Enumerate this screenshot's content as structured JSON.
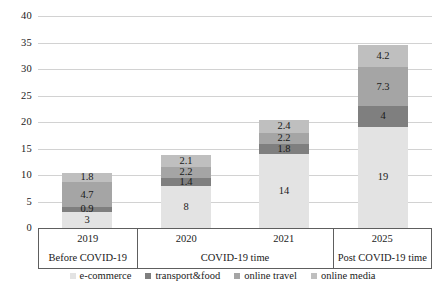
{
  "chart_data": {
    "type": "bar",
    "subtype": "stacked-bar",
    "title": "",
    "subtitle": "",
    "xlabel": "",
    "ylabel": "",
    "ylim": [
      0,
      40
    ],
    "ytick_labels": [
      "0",
      "5",
      "10",
      "15",
      "20",
      "25",
      "30",
      "35",
      "40"
    ],
    "ytick_values": [
      0,
      5,
      10,
      15,
      20,
      25,
      30,
      35,
      40
    ],
    "grid": true,
    "legend_position": "bottom",
    "categories": [
      "2019",
      "2020",
      "2021",
      "2025"
    ],
    "series": [
      {
        "name": "e-commerce",
        "color": "#e3e3e3",
        "values": [
          3,
          8,
          14,
          19
        ],
        "labels": [
          "3",
          "8",
          "14",
          "19"
        ]
      },
      {
        "name": "transport&food",
        "color": "#7f7f7f",
        "values": [
          0.9,
          1.4,
          1.8,
          4
        ],
        "labels": [
          "0.9",
          "1.4",
          "1.8",
          "4"
        ]
      },
      {
        "name": "online travel",
        "color": "#a5a5a5",
        "values": [
          4.7,
          2.2,
          2.2,
          7.3
        ],
        "labels": [
          "4.7",
          "2.2",
          "2.2",
          "7.3"
        ]
      },
      {
        "name": "online media",
        "color": "#bfbfbf",
        "values": [
          1.8,
          2.1,
          2.4,
          4.2
        ],
        "labels": [
          "1.8",
          "2.1",
          "2.4",
          "4.2"
        ]
      }
    ],
    "totals": [
      10.4,
      13.7,
      20.4,
      34.5
    ],
    "period_groups": [
      {
        "label": "Before COVID-19",
        "years": [
          "2019"
        ]
      },
      {
        "label": "COVID-19 time",
        "years": [
          "2020",
          "2021"
        ]
      },
      {
        "label": "Post COVID-19 time",
        "years": [
          "2025"
        ]
      }
    ]
  },
  "axis": {
    "yticks": [
      "40",
      "35",
      "30",
      "25",
      "20",
      "15",
      "10",
      "5",
      "0"
    ]
  },
  "legend": {
    "items": [
      {
        "label": "e-commerce",
        "color": "#e3e3e3"
      },
      {
        "label": "transport&food",
        "color": "#7f7f7f"
      },
      {
        "label": "online travel",
        "color": "#a5a5a5"
      },
      {
        "label": "online media",
        "color": "#bfbfbf"
      }
    ]
  },
  "colors": {
    "gridline": "#d2d2d2",
    "axis": "#5e5e5e",
    "text": "#1a1a1a",
    "background": "#ffffff"
  }
}
